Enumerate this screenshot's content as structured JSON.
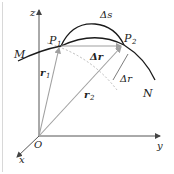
{
  "diagram": {
    "axes": {
      "x": "x",
      "y": "y",
      "z": "z",
      "origin": "O"
    },
    "points": {
      "p1": "P",
      "p1_sub": "1",
      "p2": "P",
      "p2_sub": "2"
    },
    "curve_ends": {
      "start": "M",
      "end": "N"
    },
    "vectors": {
      "r1": "r",
      "r1_sub": "1",
      "r2": "r",
      "r2_sub": "2",
      "delta_r_vec": "Δr"
    },
    "scalars": {
      "delta_s": "Δs",
      "delta_r_mag": "Δr"
    },
    "colors": {
      "curve": "#1a1a1a",
      "vector": "#a0a0a0",
      "axis": "#555555",
      "dashed": "#aaaaaa"
    }
  }
}
